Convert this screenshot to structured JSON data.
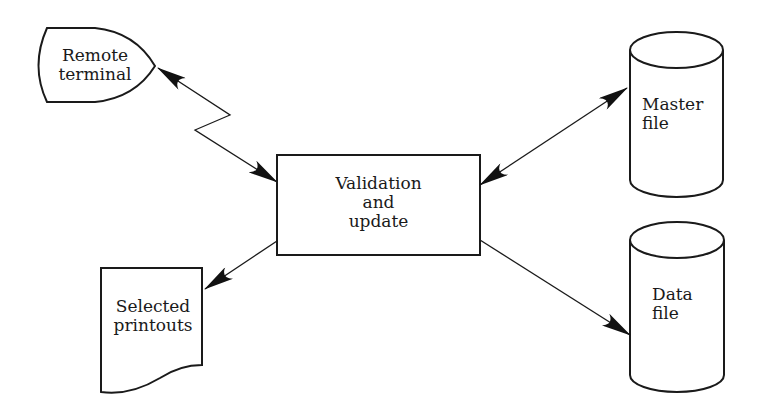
{
  "diagram": {
    "type": "system flowchart",
    "colors": {
      "stroke": "#1a1a1a",
      "background": "#ffffff"
    },
    "nodes": {
      "remote_terminal": {
        "shape": "terminal-display",
        "line1": "Remote",
        "line2": "terminal"
      },
      "process": {
        "shape": "process-box",
        "line1": "Validation",
        "line2": "and",
        "line3": "update"
      },
      "master_file": {
        "shape": "cylinder-disk",
        "line1": "Master",
        "line2": "file"
      },
      "data_file": {
        "shape": "cylinder-disk",
        "line1": "Data",
        "line2": "file"
      },
      "printouts": {
        "shape": "document",
        "line1": "Selected",
        "line2": "printouts"
      }
    },
    "edges": [
      {
        "from": "Remote terminal",
        "to": "Validation and update",
        "style": "communication-link (zigzag)",
        "direction": "bidirectional"
      },
      {
        "from": "Master file",
        "to": "Validation and update",
        "style": "straight",
        "direction": "bidirectional"
      },
      {
        "from": "Validation and update",
        "to": "Selected printouts",
        "style": "straight",
        "direction": "one-way"
      },
      {
        "from": "Validation and update",
        "to": "Data file",
        "style": "straight",
        "direction": "one-way"
      }
    ]
  }
}
